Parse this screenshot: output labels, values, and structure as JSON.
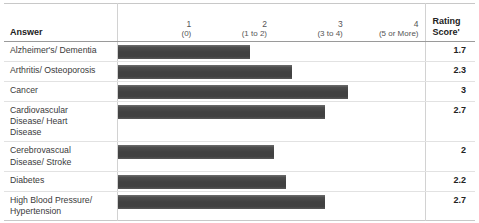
{
  "chart_data": {
    "type": "bar",
    "title": "",
    "xlabel": "",
    "ylabel": "",
    "orientation": "horizontal",
    "xlim": [
      0,
      4
    ],
    "grid": false,
    "legend": null,
    "categories": [
      "Alzheimer's/ Dementia",
      "Arthritis/ Osteoporosis",
      "Cancer",
      "Cardiovascular Disease/ Heart Disease",
      "Cerebrovascual Disease/ Stroke",
      "Diabetes",
      "High Blood Pressure/ Hypertension"
    ],
    "values": [
      1.7,
      2.3,
      3,
      2.7,
      2,
      2.2,
      2.7
    ],
    "value_label_column": "Rating Score'",
    "axis_ticks": [
      {
        "num": "1",
        "range": "(0)"
      },
      {
        "num": "2",
        "range": "(1 to 2)"
      },
      {
        "num": "3",
        "range": "(3 to 4)"
      },
      {
        "num": "4",
        "range": "(5 or More)"
      }
    ],
    "bar_color": "#414141"
  },
  "table": {
    "columns": {
      "answer": "Answer",
      "rating_score_line1": "Rating",
      "rating_score_line2": "Score'"
    },
    "scale": [
      {
        "num": "1",
        "range": "(0)"
      },
      {
        "num": "2",
        "range": "(1 to 2)"
      },
      {
        "num": "3",
        "range": "(3 to 4)"
      },
      {
        "num": "4",
        "range": "(5 or More)"
      }
    ],
    "rows": [
      {
        "label": "Alzheimer's/ Dementia",
        "score": "1.7",
        "bar_width_pct": 43
      },
      {
        "label": "Arthritis/ Osteoporosis",
        "score": "2.3",
        "bar_width_pct": 57
      },
      {
        "label": "Cancer",
        "score": "3",
        "bar_width_pct": 75
      },
      {
        "label": "Cardiovascular\nDisease/ Heart\nDisease",
        "score": "2.7",
        "bar_width_pct": 67.5
      },
      {
        "label": "Cerebrovascual\nDisease/ Stroke",
        "score": "2",
        "bar_width_pct": 51
      },
      {
        "label": "Diabetes",
        "score": "2.2",
        "bar_width_pct": 55
      },
      {
        "label": "High Blood Pressure/\nHypertension",
        "score": "2.7",
        "bar_width_pct": 67.5
      }
    ]
  }
}
